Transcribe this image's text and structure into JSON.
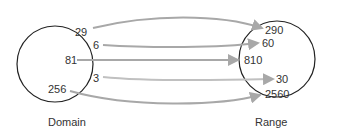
{
  "diagram": {
    "domain": {
      "caption": "Domain",
      "values": [
        "29",
        "6",
        "81",
        "3",
        "256"
      ]
    },
    "range": {
      "caption": "Range",
      "values": [
        "290",
        "60",
        "810",
        "30",
        "2560"
      ]
    },
    "mappings": [
      {
        "from": "29",
        "to": "290"
      },
      {
        "from": "6",
        "to": "60"
      },
      {
        "from": "81",
        "to": "810"
      },
      {
        "from": "3",
        "to": "30"
      },
      {
        "from": "256",
        "to": "2560"
      }
    ],
    "colors": {
      "circle": "#222222",
      "arrow": "#a8a8a8",
      "text": "#333333"
    }
  }
}
